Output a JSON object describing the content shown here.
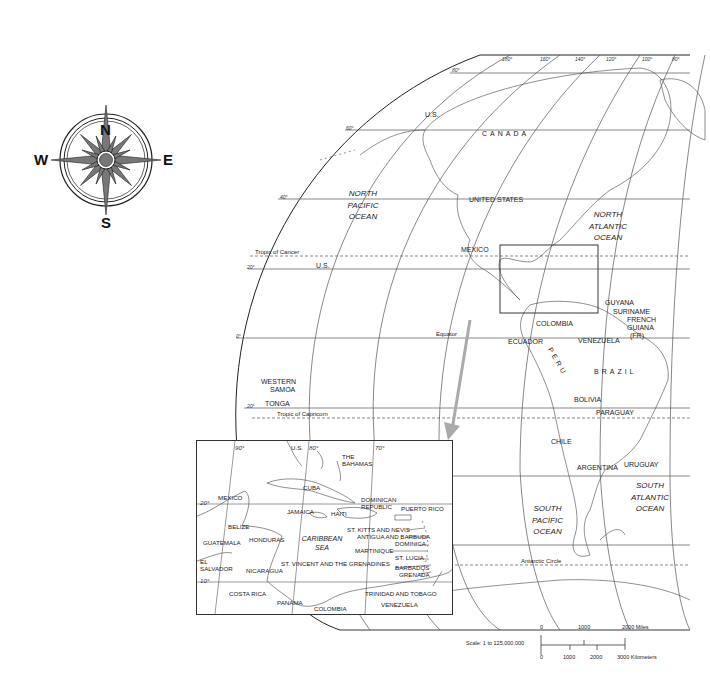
{
  "compass": {
    "north": "N",
    "south": "S",
    "east": "E",
    "west": "W"
  },
  "main_map": {
    "countries": {
      "us_alaska": "U.S.",
      "canada": "CANADA",
      "united_states": "UNITED  STATES",
      "mexico": "MEXICO",
      "us_hawaii": "U.S.",
      "guyana": "GUYANA",
      "suriname": "SURINAME",
      "french_guiana": "FRENCH",
      "french_guiana_2": "GUIANA",
      "french_guiana_3": "(FR)",
      "colombia": "COLOMBIA",
      "venezuela": "VENEZUELA",
      "ecuador": "ECUADOR",
      "peru": "PERU",
      "brazil": "BRAZIL",
      "bolivia": "BOLIVIA",
      "paraguay": "PARAGUAY",
      "chile": "CHILE",
      "argentina": "ARGENTINA",
      "uruguay": "URUGUAY",
      "western_samoa_1": "WESTERN",
      "western_samoa_2": "SAMOA",
      "tonga": "TONGA"
    },
    "oceans": {
      "north_pacific": [
        "NORTH",
        "PACIFIC",
        "OCEAN"
      ],
      "north_atlantic": [
        "NORTH",
        "ATLANTIC",
        "OCEAN"
      ],
      "south_pacific": [
        "SOUTH",
        "PACIFIC",
        "OCEAN"
      ],
      "south_atlantic": [
        "SOUTH",
        "ATLANTIC",
        "OCEAN"
      ]
    },
    "lines": {
      "tropic_of_cancer": "Tropic of Cancer",
      "equator": "Equator",
      "tropic_of_capricorn": "Tropic of Capricorn",
      "antarctic_circle": "Antarctic Circle"
    },
    "longitudes": [
      "180°",
      "160°",
      "140°",
      "120°",
      "100°",
      "80°",
      "60°"
    ],
    "latitudes": [
      "80°",
      "60°",
      "40°",
      "20°",
      "0°",
      "20°"
    ]
  },
  "inset": {
    "longitudes": [
      "90°",
      "80°",
      "70°"
    ],
    "latitudes": [
      "20°",
      "10°"
    ],
    "labels": {
      "us": "U.S.",
      "bahamas_1": "THE",
      "bahamas_2": "BAHAMAS",
      "cuba": "CUBA",
      "mexico": "MEXICO",
      "dominican_1": "DOMINICAN",
      "dominican_2": "REPUBLIC",
      "puerto_rico": "PUERTO RICO",
      "jamaica": "JAMAICA",
      "haiti": "HAITI",
      "belize": "BELIZE",
      "st_kitts": "ST. KITTS AND NEVIS",
      "antigua": "ANTIGUA AND BARBUDA",
      "guatemala": "GUATEMALA",
      "honduras": "HONDURAS",
      "caribbean_1": "CARIBBEAN",
      "caribbean_2": "SEA",
      "dominica": "DOMINICA",
      "martinique": "MARTINIQUE",
      "st_lucia": "ST. LUCIA",
      "el_salvador_1": "EL",
      "el_salvador_2": "SALVADOR",
      "st_vincent": "ST. VINCENT AND THE GRENADINES",
      "barbados": "BARBADOS",
      "grenada": "GRENADA",
      "nicaragua": "NICARAGUA",
      "costa_rica": "COSTA RICA",
      "panama": "PANAMA",
      "trinidad": "TRINIDAD AND TOBAGO",
      "colombia": "COLOMBIA",
      "venezuela": "VENEZUELA"
    }
  },
  "scale": {
    "label": "Scale:  1 to 125,000,000",
    "miles": [
      "0",
      "1000",
      "2000 Miles"
    ],
    "kilometers": [
      "0",
      "1000",
      "2000",
      "3000 Kilometers"
    ]
  },
  "colors": {
    "line": "#333333",
    "arrow": "#aaaaaa",
    "background": "#ffffff"
  }
}
